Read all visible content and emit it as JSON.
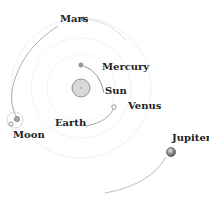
{
  "diagram": {
    "title": "",
    "bodies": [
      {
        "id": "sun",
        "label": "Sun"
      },
      {
        "id": "mercury",
        "label": "Mercury"
      },
      {
        "id": "venus",
        "label": "Venus"
      },
      {
        "id": "earth",
        "label": "Earth"
      },
      {
        "id": "moon",
        "label": "Moon"
      },
      {
        "id": "mars",
        "label": "Mars"
      },
      {
        "id": "jupiter",
        "label": "Jupiter"
      }
    ],
    "colors": {
      "orbit": "#b8b8b8",
      "faint_orbit": "#ececec",
      "sun_fill": "#d6d6d6",
      "planet_fill": "#9a9a9a",
      "text": "#222222"
    }
  }
}
